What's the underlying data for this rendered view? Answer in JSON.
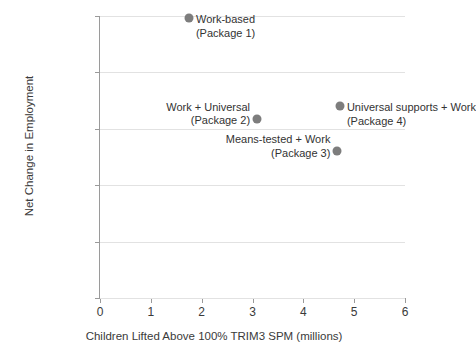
{
  "chart_data": {
    "type": "scatter",
    "title": "",
    "xlabel": "Children Lifted Above 100% TRIM3 SPM (millions)",
    "ylabel": "Net Change in Employment",
    "xlim": [
      0,
      6
    ],
    "ylim": [
      -250000,
      1000000
    ],
    "xticks": [
      "0",
      "1",
      "2",
      "3",
      "4",
      "5",
      "6"
    ],
    "xtick_values": [
      0,
      1,
      2,
      3,
      4,
      5,
      6
    ],
    "yticks": [
      "-250,000",
      "0",
      "250,000",
      "500,000",
      "750,000",
      "1,000,000"
    ],
    "ytick_values": [
      -250000,
      0,
      250000,
      500000,
      750000,
      1000000
    ],
    "grid": "horizontal",
    "legend": "none",
    "marker_color": "#7d7d7d",
    "gridline_color": "#e2e2e2",
    "axis_color": "#9a9a9a",
    "points": [
      {
        "name": "Work-based (Package 1)",
        "label_line1": "Work-based",
        "label_line2": "(Package 1)",
        "x": 1.75,
        "y": 990000,
        "label_side": "right"
      },
      {
        "name": "Work + Universal (Package 2)",
        "label_line1": "Work + Universal",
        "label_line2": "(Package 2)",
        "x": 3.09,
        "y": 545000,
        "label_side": "left"
      },
      {
        "name": "Means-tested + Work (Package 3)",
        "label_line1": "Means-tested + Work",
        "label_line2": "(Package 3)",
        "x": 4.67,
        "y": 400000,
        "label_side": "left"
      },
      {
        "name": "Universal supports + Work (Package 4)",
        "label_line1": "Universal supports + Work",
        "label_line2": "(Package 4)",
        "x": 4.72,
        "y": 600000,
        "label_side": "right"
      }
    ]
  }
}
